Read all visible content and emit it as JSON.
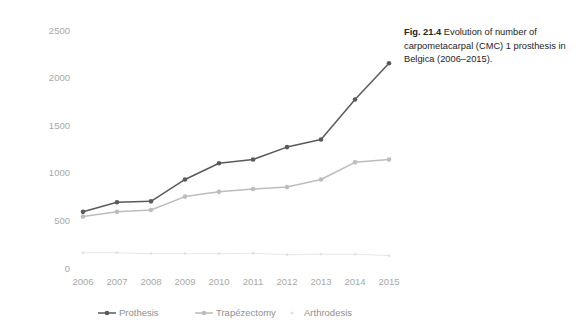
{
  "caption": {
    "fig_number": "Fig. 21.4",
    "text": " Evolution of number of carpometacarpal (CMC) 1 prosthesis in Belgica (2006–2015)."
  },
  "chart_data": {
    "type": "line",
    "title": "",
    "xlabel": "",
    "ylabel": "",
    "categories": [
      "2006",
      "2007",
      "2008",
      "2009",
      "2010",
      "2011",
      "2012",
      "2013",
      "2014",
      "2015"
    ],
    "yticks": [
      0,
      500,
      1000,
      1500,
      2000,
      2500
    ],
    "ytick_labels": [
      "0",
      "500",
      "1000",
      "1500",
      "2000",
      "2500"
    ],
    "ylim": [
      0,
      2500
    ],
    "grid": false,
    "legend_position": "bottom",
    "series": [
      {
        "name": "Prothesis",
        "color": "#5a5a5a",
        "marker": "circle",
        "values": [
          590,
          690,
          700,
          930,
          1100,
          1140,
          1270,
          1350,
          1770,
          2150
        ]
      },
      {
        "name": "Trapézectomy",
        "color": "#bdbdbd",
        "marker": "circle",
        "values": [
          540,
          590,
          610,
          750,
          800,
          830,
          850,
          930,
          1110,
          1140
        ]
      },
      {
        "name": "Arthrodesis",
        "color": "#e3e3e3",
        "marker": "dot",
        "values": [
          160,
          160,
          150,
          150,
          150,
          155,
          140,
          145,
          145,
          130
        ]
      }
    ]
  }
}
